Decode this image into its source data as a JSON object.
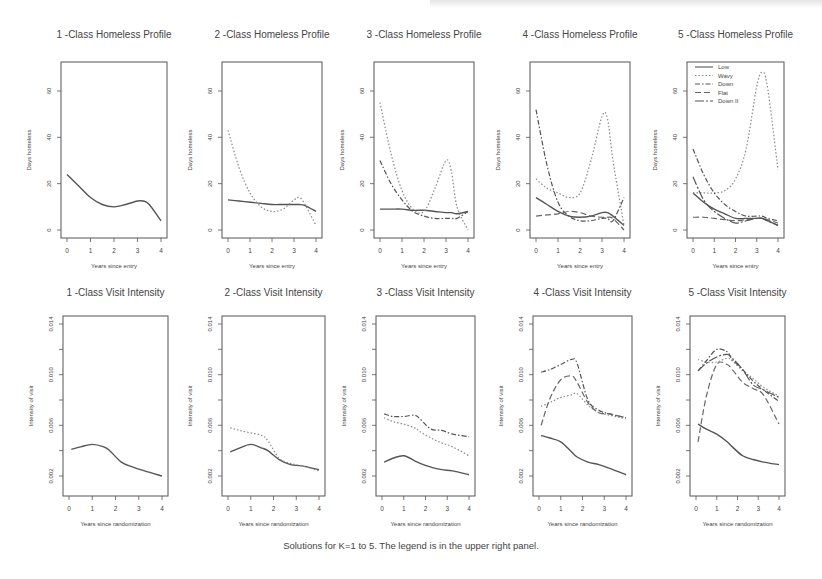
{
  "figure": {
    "caption": "Solutions for K=1 to 5.  The legend is in the upper right panel."
  },
  "legend": {
    "panel": 5,
    "entries": [
      {
        "label": "Low",
        "dash": ""
      },
      {
        "label": "Wavy",
        "dash": "1.5,2"
      },
      {
        "label": "Down",
        "dash": "5,2,1.5,2"
      },
      {
        "label": "Flat",
        "dash": "6,3"
      },
      {
        "label": "Down II",
        "dash": "9,2,2,2"
      }
    ]
  },
  "chart_data": [
    {
      "type": "line",
      "title": "1 -Class Homeless Profile",
      "xlabel": "Years since entry",
      "ylabel": "Days homeless",
      "xlim": [
        0,
        4
      ],
      "ylim": [
        -2,
        70
      ],
      "xticks": [
        0,
        1,
        2,
        3,
        4
      ],
      "yticks": [
        0,
        20,
        40,
        60
      ],
      "x": [
        0,
        0.5,
        1,
        1.5,
        2,
        2.5,
        3,
        3.25,
        3.5,
        4
      ],
      "series": [
        {
          "name": "Low",
          "values": [
            24,
            19,
            14,
            11,
            10,
            11,
            12.5,
            12.5,
            11,
            4
          ]
        }
      ]
    },
    {
      "type": "line",
      "title": "2 -Class Homeless Profile",
      "xlabel": "Years since entry",
      "ylabel": "Days homeless",
      "xlim": [
        0,
        4
      ],
      "ylim": [
        -2,
        70
      ],
      "xticks": [
        0,
        1,
        2,
        3,
        4
      ],
      "yticks": [
        0,
        20,
        40,
        60
      ],
      "x": [
        0,
        0.5,
        1,
        1.5,
        2,
        2.5,
        3,
        3.25,
        3.5,
        4
      ],
      "series": [
        {
          "name": "Low",
          "values": [
            13,
            12.5,
            12,
            11.5,
            11,
            11,
            11,
            11,
            10.5,
            8
          ]
        },
        {
          "name": "Wavy",
          "values": [
            43,
            27,
            16,
            10,
            8,
            9,
            13,
            14,
            11,
            2
          ]
        }
      ]
    },
    {
      "type": "line",
      "title": "3 -Class Homeless Profile",
      "xlabel": "Years since entry",
      "ylabel": "Days homeless",
      "xlim": [
        0,
        4
      ],
      "ylim": [
        -2,
        70
      ],
      "xticks": [
        0,
        1,
        2,
        3,
        4
      ],
      "yticks": [
        0,
        20,
        40,
        60
      ],
      "x": [
        0,
        0.5,
        1,
        1.5,
        2,
        2.5,
        3,
        3.25,
        3.5,
        4
      ],
      "series": [
        {
          "name": "Low",
          "values": [
            9,
            9,
            9,
            8.5,
            8.5,
            8,
            7.5,
            7.5,
            7,
            8
          ]
        },
        {
          "name": "Wavy",
          "values": [
            55,
            33,
            17,
            9,
            8,
            18,
            30,
            25,
            10,
            0
          ]
        },
        {
          "name": "Down",
          "values": [
            30,
            20,
            13,
            8,
            6,
            5,
            5,
            5,
            5,
            8
          ]
        }
      ]
    },
    {
      "type": "line",
      "title": "4 -Class Homeless Profile",
      "xlabel": "Years since entry",
      "ylabel": "Days homeless",
      "xlim": [
        0,
        4
      ],
      "ylim": [
        -2,
        70
      ],
      "xticks": [
        0,
        1,
        2,
        3,
        4
      ],
      "yticks": [
        0,
        20,
        40,
        60
      ],
      "x": [
        0,
        0.5,
        1,
        1.5,
        2,
        2.5,
        3,
        3.25,
        3.5,
        4
      ],
      "series": [
        {
          "name": "Low",
          "values": [
            14,
            11,
            8,
            6,
            5.5,
            6,
            7.5,
            7.5,
            6,
            2
          ]
        },
        {
          "name": "Wavy",
          "values": [
            22,
            18,
            16,
            14,
            16,
            30,
            49,
            48,
            30,
            2
          ]
        },
        {
          "name": "Down",
          "values": [
            52,
            28,
            12,
            6,
            4,
            4,
            5,
            5,
            4,
            14
          ]
        },
        {
          "name": "Flat",
          "values": [
            6,
            6.5,
            7,
            8,
            7.5,
            6,
            5.5,
            5.5,
            5,
            0
          ]
        }
      ]
    },
    {
      "type": "line",
      "title": "5 -Class Homeless Profile",
      "xlabel": "Years since entry",
      "ylabel": "Days homeless",
      "xlim": [
        0,
        4
      ],
      "ylim": [
        -2,
        70
      ],
      "xticks": [
        0,
        1,
        2,
        3,
        4
      ],
      "yticks": [
        0,
        20,
        40,
        60
      ],
      "x": [
        0,
        0.5,
        1,
        1.5,
        2,
        2.5,
        3,
        3.25,
        3.5,
        4
      ],
      "series": [
        {
          "name": "Low",
          "values": [
            16,
            12,
            9,
            7,
            5,
            5,
            5,
            5,
            4,
            2
          ]
        },
        {
          "name": "Wavy",
          "values": [
            16,
            16,
            16,
            17,
            22,
            35,
            62,
            68,
            62,
            26
          ]
        },
        {
          "name": "Down",
          "values": [
            35,
            24,
            16,
            11,
            8,
            6,
            6,
            6,
            5,
            4
          ]
        },
        {
          "name": "Flat",
          "values": [
            5.5,
            5.5,
            5,
            4.5,
            4,
            4.5,
            5,
            5,
            4.5,
            3
          ]
        },
        {
          "name": "Down II",
          "values": [
            23,
            13,
            8,
            5,
            3,
            4,
            5,
            5,
            4,
            2
          ]
        }
      ]
    },
    {
      "type": "line",
      "title": "1 -Class Visit Intensity",
      "xlabel": "Years since randomization",
      "ylabel": "Intensity of visit",
      "xlim": [
        0,
        4
      ],
      "ylim": [
        0,
        0.0145
      ],
      "xticks": [
        0,
        1,
        2,
        3,
        4
      ],
      "yticks": [
        0.002,
        0.006,
        0.01,
        0.014
      ],
      "x": [
        0.1,
        0.5,
        1,
        1.5,
        1.75,
        2.25,
        2.75,
        3.25,
        4
      ],
      "series": [
        {
          "name": "Low",
          "values": [
            0.0041,
            0.0043,
            0.0045,
            0.0043,
            0.004,
            0.0031,
            0.0027,
            0.0024,
            0.002
          ]
        }
      ]
    },
    {
      "type": "line",
      "title": "2 -Class Visit Intensity",
      "xlabel": "Years since randomization",
      "ylabel": "Intensity of visit",
      "xlim": [
        0,
        4
      ],
      "ylim": [
        0,
        0.0145
      ],
      "xticks": [
        0,
        1,
        2,
        3,
        4
      ],
      "yticks": [
        0.002,
        0.006,
        0.01,
        0.014
      ],
      "x": [
        0.1,
        0.5,
        1,
        1.5,
        1.75,
        2.25,
        2.75,
        3.25,
        4
      ],
      "series": [
        {
          "name": "Low",
          "values": [
            0.0039,
            0.0042,
            0.0045,
            0.0042,
            0.004,
            0.0033,
            0.0029,
            0.0028,
            0.0025
          ]
        },
        {
          "name": "Wavy",
          "values": [
            0.0058,
            0.0056,
            0.0054,
            0.0052,
            0.0048,
            0.0034,
            0.003,
            0.0028,
            0.0024
          ]
        }
      ]
    },
    {
      "type": "line",
      "title": "3 -Class Visit Intensity",
      "xlabel": "Years since randomization",
      "ylabel": "Intensity of visit",
      "xlim": [
        0,
        4
      ],
      "ylim": [
        0,
        0.0145
      ],
      "xticks": [
        0,
        1,
        2,
        3,
        4
      ],
      "yticks": [
        0.002,
        0.006,
        0.01,
        0.014
      ],
      "x": [
        0.1,
        0.5,
        1,
        1.5,
        1.75,
        2.25,
        2.75,
        3.25,
        4
      ],
      "series": [
        {
          "name": "Low",
          "values": [
            0.0031,
            0.0034,
            0.0036,
            0.0032,
            0.003,
            0.0027,
            0.0025,
            0.0024,
            0.0021
          ]
        },
        {
          "name": "Wavy",
          "values": [
            0.0066,
            0.0063,
            0.0061,
            0.0058,
            0.0055,
            0.005,
            0.0046,
            0.0043,
            0.0036
          ]
        },
        {
          "name": "Down",
          "values": [
            0.0069,
            0.0067,
            0.0067,
            0.0068,
            0.0065,
            0.0057,
            0.0056,
            0.0053,
            0.0051
          ]
        }
      ]
    },
    {
      "type": "line",
      "title": "4 -Class Visit Intensity",
      "xlabel": "Years since randomization",
      "ylabel": "Intensity of visit",
      "xlim": [
        0,
        4
      ],
      "ylim": [
        0,
        0.0145
      ],
      "xticks": [
        0,
        1,
        2,
        3,
        4
      ],
      "yticks": [
        0.002,
        0.006,
        0.01,
        0.014
      ],
      "x": [
        0.1,
        0.5,
        1,
        1.5,
        1.75,
        2.25,
        2.75,
        3.25,
        4
      ],
      "series": [
        {
          "name": "Low",
          "values": [
            0.0052,
            0.005,
            0.0047,
            0.0039,
            0.0035,
            0.0031,
            0.0029,
            0.0026,
            0.0021
          ]
        },
        {
          "name": "Wavy",
          "values": [
            0.0075,
            0.0078,
            0.0082,
            0.0084,
            0.0085,
            0.0076,
            0.007,
            0.0068,
            0.0065
          ]
        },
        {
          "name": "Down",
          "values": [
            0.0102,
            0.0104,
            0.0108,
            0.0112,
            0.0109,
            0.008,
            0.0072,
            0.0069,
            0.0066
          ]
        },
        {
          "name": "Flat",
          "values": [
            0.006,
            0.0081,
            0.0096,
            0.0099,
            0.0094,
            0.0078,
            0.007,
            0.0069,
            0.0066
          ]
        }
      ]
    },
    {
      "type": "line",
      "title": "5 -Class Visit Intensity",
      "xlabel": "Years since randomization",
      "ylabel": "Intensity of visit",
      "xlim": [
        0,
        4
      ],
      "ylim": [
        0,
        0.0145
      ],
      "xticks": [
        0,
        1,
        2,
        3,
        4
      ],
      "yticks": [
        0.002,
        0.006,
        0.01,
        0.014
      ],
      "x": [
        0.1,
        0.5,
        1,
        1.5,
        1.75,
        2.25,
        2.75,
        3.25,
        4
      ],
      "series": [
        {
          "name": "Low",
          "values": [
            0.0061,
            0.0057,
            0.0053,
            0.0047,
            0.0043,
            0.0036,
            0.0033,
            0.0031,
            0.0029
          ]
        },
        {
          "name": "Wavy",
          "values": [
            0.0112,
            0.011,
            0.011,
            0.0113,
            0.0111,
            0.0103,
            0.0097,
            0.009,
            0.0083
          ]
        },
        {
          "name": "Down",
          "values": [
            0.0103,
            0.0111,
            0.012,
            0.0118,
            0.0112,
            0.0104,
            0.0095,
            0.0088,
            0.0079
          ]
        },
        {
          "name": "Flat",
          "values": [
            0.0047,
            0.0083,
            0.0108,
            0.0108,
            0.0104,
            0.0094,
            0.0089,
            0.0084,
            0.0061
          ]
        },
        {
          "name": "Down II",
          "values": [
            0.0103,
            0.0109,
            0.0114,
            0.0116,
            0.0113,
            0.0104,
            0.0092,
            0.0088,
            0.0082
          ]
        }
      ]
    }
  ]
}
